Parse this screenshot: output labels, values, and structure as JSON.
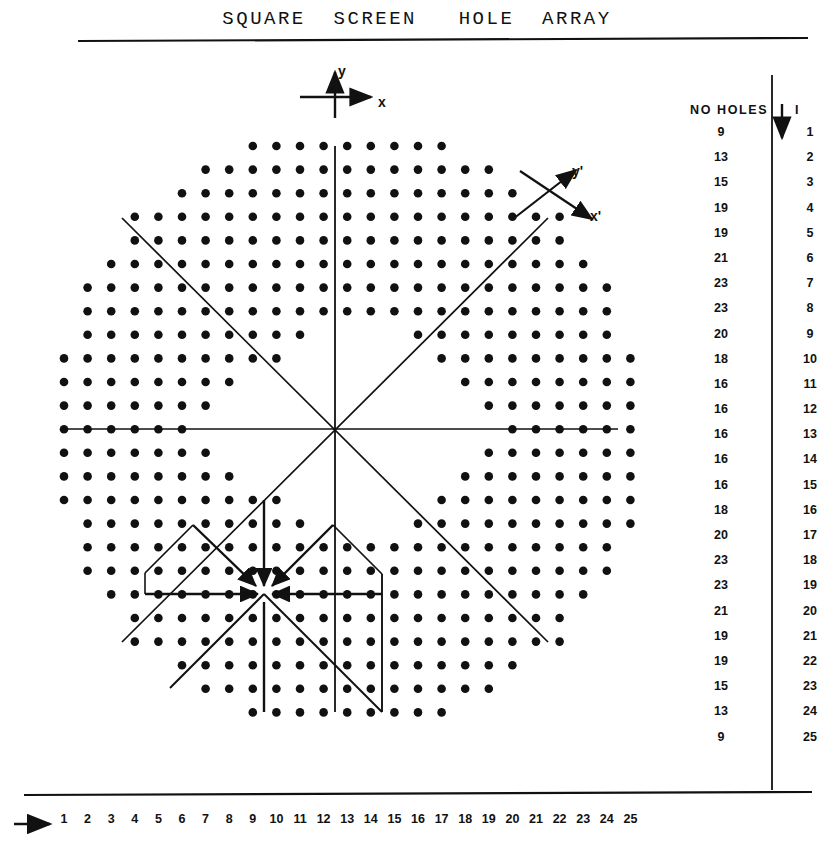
{
  "figure": {
    "title": "SQUARE  SCREEN   HOLE  ARRAY",
    "axis_labels": {
      "x": "x",
      "y": "y",
      "x_prime": "x'",
      "y_prime": "y'"
    }
  },
  "table": {
    "header_holes": "NO HOLES",
    "header_index": "I",
    "arrow_icon": "down-arrow",
    "rows": [
      {
        "holes": "9",
        "index": "1"
      },
      {
        "holes": "13",
        "index": "2"
      },
      {
        "holes": "15",
        "index": "3"
      },
      {
        "holes": "19",
        "index": "4"
      },
      {
        "holes": "19",
        "index": "5"
      },
      {
        "holes": "21",
        "index": "6"
      },
      {
        "holes": "23",
        "index": "7"
      },
      {
        "holes": "23",
        "index": "8"
      },
      {
        "holes": "20",
        "index": "9"
      },
      {
        "holes": "18",
        "index": "10"
      },
      {
        "holes": "16",
        "index": "11"
      },
      {
        "holes": "16",
        "index": "12"
      },
      {
        "holes": "16",
        "index": "13"
      },
      {
        "holes": "16",
        "index": "14"
      },
      {
        "holes": "16",
        "index": "15"
      },
      {
        "holes": "18",
        "index": "16"
      },
      {
        "holes": "20",
        "index": "17"
      },
      {
        "holes": "23",
        "index": "18"
      },
      {
        "holes": "23",
        "index": "19"
      },
      {
        "holes": "21",
        "index": "20"
      },
      {
        "holes": "19",
        "index": "21"
      },
      {
        "holes": "19",
        "index": "22"
      },
      {
        "holes": "15",
        "index": "23"
      },
      {
        "holes": "13",
        "index": "24"
      },
      {
        "holes": "9",
        "index": "25"
      }
    ]
  },
  "column_scale": {
    "arrow_icon": "right-arrow",
    "labels": [
      "1",
      "2",
      "3",
      "4",
      "5",
      "6",
      "7",
      "8",
      "9",
      "10",
      "11",
      "12",
      "13",
      "14",
      "15",
      "16",
      "17",
      "18",
      "19",
      "20",
      "21",
      "22",
      "23",
      "24",
      "25"
    ]
  },
  "chart_data": {
    "type": "scatter",
    "title": "SQUARE  SCREEN   HOLE  ARRAY",
    "xlabel": "x",
    "ylabel": "y",
    "grid": false,
    "legend": "none",
    "lattice": {
      "columns": 25,
      "rows": 25,
      "origin_px": [
        64.0,
        146.0
      ],
      "pitch_px": 23.6
    },
    "row_hole_counts": [
      9,
      13,
      15,
      19,
      19,
      21,
      23,
      23,
      20,
      18,
      16,
      16,
      16,
      16,
      16,
      18,
      20,
      23,
      23,
      21,
      19,
      19,
      15,
      13,
      9
    ],
    "row_spans": [
      {
        "row": 1,
        "segments": [
          [
            9,
            17
          ]
        ]
      },
      {
        "row": 2,
        "segments": [
          [
            7,
            19
          ]
        ]
      },
      {
        "row": 3,
        "segments": [
          [
            6,
            20
          ]
        ]
      },
      {
        "row": 4,
        "segments": [
          [
            4,
            22
          ]
        ]
      },
      {
        "row": 5,
        "segments": [
          [
            4,
            22
          ]
        ]
      },
      {
        "row": 6,
        "segments": [
          [
            3,
            23
          ]
        ]
      },
      {
        "row": 7,
        "segments": [
          [
            2,
            24
          ]
        ]
      },
      {
        "row": 8,
        "segments": [
          [
            2,
            24
          ]
        ]
      },
      {
        "row": 9,
        "segments": [
          [
            2,
            11
          ],
          [
            16,
            24
          ]
        ]
      },
      {
        "row": 10,
        "segments": [
          [
            1,
            10
          ],
          [
            17,
            25
          ]
        ]
      },
      {
        "row": 11,
        "segments": [
          [
            1,
            8
          ],
          [
            18,
            25
          ]
        ]
      },
      {
        "row": 12,
        "segments": [
          [
            1,
            7
          ],
          [
            19,
            25
          ]
        ]
      },
      {
        "row": 13,
        "segments": [
          [
            1,
            6
          ],
          [
            20,
            25
          ]
        ]
      },
      {
        "row": 14,
        "segments": [
          [
            1,
            7
          ],
          [
            19,
            25
          ]
        ]
      },
      {
        "row": 15,
        "segments": [
          [
            1,
            8
          ],
          [
            18,
            25
          ]
        ]
      },
      {
        "row": 16,
        "segments": [
          [
            1,
            10
          ],
          [
            17,
            25
          ]
        ]
      },
      {
        "row": 17,
        "segments": [
          [
            2,
            11
          ],
          [
            16,
            25
          ]
        ]
      },
      {
        "row": 18,
        "segments": [
          [
            2,
            24
          ]
        ]
      },
      {
        "row": 19,
        "segments": [
          [
            2,
            24
          ]
        ]
      },
      {
        "row": 20,
        "segments": [
          [
            3,
            23
          ]
        ]
      },
      {
        "row": 21,
        "segments": [
          [
            4,
            22
          ]
        ]
      },
      {
        "row": 22,
        "segments": [
          [
            4,
            22
          ]
        ]
      },
      {
        "row": 23,
        "segments": [
          [
            6,
            20
          ]
        ]
      },
      {
        "row": 24,
        "segments": [
          [
            7,
            19
          ]
        ]
      },
      {
        "row": 25,
        "segments": [
          [
            9,
            17
          ]
        ]
      }
    ],
    "main_origin": {
      "col": 13,
      "row": 13,
      "px": [
        335,
        429
      ]
    },
    "secondary_origin": {
      "col": 10,
      "row": 20,
      "px": [
        264,
        594
      ]
    },
    "axes_through_origin": [
      "horizontal",
      "vertical",
      "diagonal-up-right",
      "diagonal-down-right"
    ],
    "rotated_axes": {
      "x_prime_deg": -45,
      "y_prime_deg": 45
    }
  }
}
